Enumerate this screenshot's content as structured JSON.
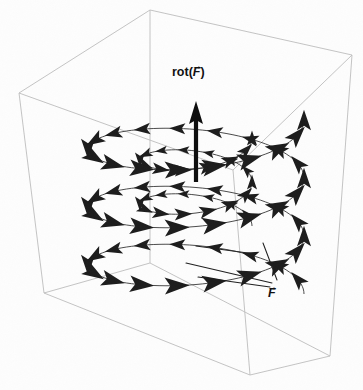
{
  "figure": {
    "kind": "vector-field-curl-diagram",
    "background_color": "#fdfdfd",
    "ink_color": "#1a1a1a",
    "box_edge_color": "#b9b9b9",
    "width": 363,
    "height": 390
  },
  "labels": {
    "curl": {
      "name": "rot-F-label",
      "prefix": "rot(",
      "symbol": "F",
      "arrow": "→",
      "suffix": ")",
      "x": 172,
      "y": 66
    },
    "field": {
      "name": "F-label",
      "prefix": "",
      "symbol": "F",
      "arrow": "→",
      "suffix": "",
      "x": 268,
      "y": 287
    }
  },
  "bounding_box": {
    "front_bottom_left": [
      44,
      293
    ],
    "front_bottom_center": [
      250,
      375
    ],
    "front_bottom_right": [
      330,
      356
    ],
    "front_top_left": [
      19,
      93
    ],
    "front_top_center": [
      233,
      170
    ],
    "front_top_right": [
      352,
      55
    ],
    "back_bottom": [
      150,
      263
    ],
    "back_top": [
      150,
      10
    ]
  },
  "curl_arrow": {
    "name": "rot-F-vector",
    "x": 196,
    "tail_y": 182,
    "head_y": 101,
    "shaft_width": 4.2,
    "head_width": 13,
    "head_length": 20,
    "direction": "up"
  },
  "field_spiral": {
    "name": "helical-vector-field",
    "center_x": 196,
    "center_y_top": 120,
    "ellipse_rx_outer": 108,
    "ellipse_ry_outer": 34,
    "ellipse_rx_inner": 56,
    "ellipse_ry_inner": 20,
    "turns": 3,
    "arrows_per_turn": 18,
    "rotation_sense": "counterclockwise-from-above",
    "vertical_pitch": 58
  },
  "leader_lines": [
    {
      "name": "leader-line-1",
      "x1": 274,
      "y1": 284,
      "x2": 186,
      "y2": 262
    },
    {
      "name": "leader-line-2",
      "x1": 272,
      "y1": 286,
      "x2": 196,
      "y2": 276
    },
    {
      "name": "leader-line-3",
      "x1": 278,
      "y1": 282,
      "x2": 262,
      "y2": 246
    }
  ]
}
